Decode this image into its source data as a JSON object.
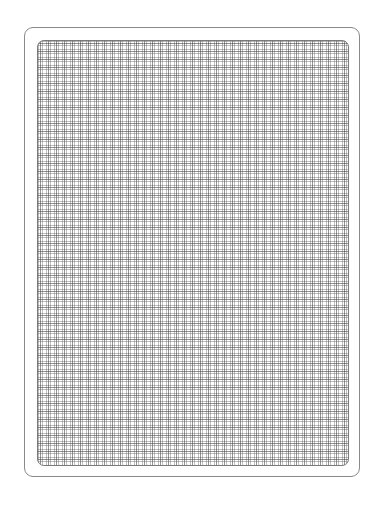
{
  "figure": {
    "outer_border": {
      "left": 24,
      "top": 27,
      "width": 336,
      "height": 450,
      "corner_radius": 9,
      "color": "#8a8a8a"
    },
    "grid": {
      "left": 37,
      "top": 40,
      "width": 312,
      "height": 426,
      "corner_radius": 7,
      "minor_spacing_px": 4,
      "major_spacing_px": 8,
      "line_color": "#6e6e6e",
      "background": "#ffffff"
    },
    "text": []
  }
}
